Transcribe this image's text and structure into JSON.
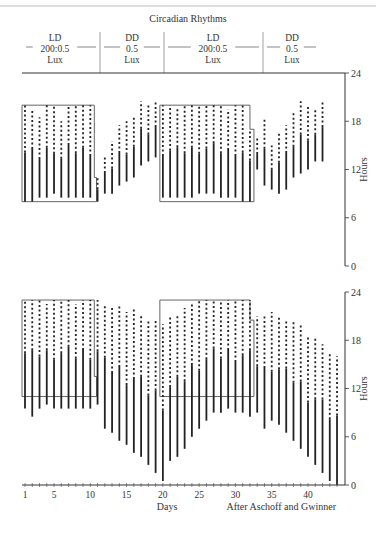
{
  "chart_data": [
    {
      "type": "actogram",
      "title": "Circadian Rhythms",
      "conditions": [
        {
          "label_lines": [
            "LD",
            "200:0.5",
            "Lux"
          ],
          "days": [
            1,
            10
          ]
        },
        {
          "label_lines": [
            "DD",
            "0.5",
            "Lux"
          ],
          "days": [
            11,
            19
          ]
        },
        {
          "label_lines": [
            "LD",
            "200:0.5",
            "Lux"
          ],
          "days": [
            20,
            32
          ]
        },
        {
          "label_lines": [
            "DD",
            "0.5",
            "Lux"
          ],
          "days": [
            33,
            43
          ]
        }
      ],
      "panel": "upper",
      "ylabel": "Hours",
      "ylim": [
        0,
        24
      ],
      "yticks": [
        0,
        6,
        12,
        18,
        24
      ],
      "light_boxes": [
        {
          "days": [
            1,
            10
          ],
          "hours": [
            8,
            20
          ],
          "step": {
            "after_day": 10.3,
            "bottom_hour": 11
          }
        },
        {
          "days": [
            20,
            32
          ],
          "hours": [
            8,
            20
          ],
          "step": {
            "after_day": 32,
            "top_hour": 17
          }
        }
      ],
      "activity": [
        {
          "day": 1,
          "start": 8,
          "end": 20
        },
        {
          "day": 2,
          "start": 8,
          "end": 19.5
        },
        {
          "day": 3,
          "start": 8.5,
          "end": 18.5
        },
        {
          "day": 4,
          "start": 8.5,
          "end": 20
        },
        {
          "day": 5,
          "start": 9,
          "end": 20
        },
        {
          "day": 6,
          "start": 8.5,
          "end": 18
        },
        {
          "day": 7,
          "start": 8.5,
          "end": 20
        },
        {
          "day": 8,
          "start": 8.5,
          "end": 20
        },
        {
          "day": 9,
          "start": 8.5,
          "end": 20
        },
        {
          "day": 10,
          "start": 8.5,
          "end": 20
        },
        {
          "day": 11,
          "start": 8,
          "end": 11
        },
        {
          "day": 12,
          "start": 9,
          "end": 13.5
        },
        {
          "day": 13,
          "start": 9,
          "end": 15.5
        },
        {
          "day": 14,
          "start": 10,
          "end": 17.5
        },
        {
          "day": 15,
          "start": 10.5,
          "end": 18
        },
        {
          "day": 16,
          "start": 11,
          "end": 18.5
        },
        {
          "day": 17,
          "start": 12.5,
          "end": 20.5
        },
        {
          "day": 18,
          "start": 13,
          "end": 20
        },
        {
          "day": 19,
          "start": 13.5,
          "end": 20.5
        },
        {
          "day": 20,
          "start": 8.5,
          "end": 20
        },
        {
          "day": 21,
          "start": 8.5,
          "end": 20
        },
        {
          "day": 22,
          "start": 8.5,
          "end": 19.5
        },
        {
          "day": 23,
          "start": 8.5,
          "end": 20
        },
        {
          "day": 24,
          "start": 8.5,
          "end": 20
        },
        {
          "day": 25,
          "start": 9,
          "end": 20
        },
        {
          "day": 26,
          "start": 9,
          "end": 20
        },
        {
          "day": 27,
          "start": 9,
          "end": 20
        },
        {
          "day": 28,
          "start": 8.5,
          "end": 20
        },
        {
          "day": 29,
          "start": 8.5,
          "end": 19.5
        },
        {
          "day": 30,
          "start": 8.5,
          "end": 20
        },
        {
          "day": 31,
          "start": 8,
          "end": 20
        },
        {
          "day": 32,
          "start": 8,
          "end": 17
        },
        {
          "day": 33,
          "start": 12,
          "end": 16
        },
        {
          "day": 34,
          "start": 10,
          "end": 18.5
        },
        {
          "day": 35,
          "start": 9.5,
          "end": 15
        },
        {
          "day": 36,
          "start": 9,
          "end": 16.5
        },
        {
          "day": 37,
          "start": 9.5,
          "end": 17.5
        },
        {
          "day": 38,
          "start": 11,
          "end": 19
        },
        {
          "day": 39,
          "start": 11.5,
          "end": 20.5
        },
        {
          "day": 40,
          "start": 12,
          "end": 20
        },
        {
          "day": 41,
          "start": 13,
          "end": 19.5
        },
        {
          "day": 42,
          "start": 13,
          "end": 20.5
        }
      ]
    },
    {
      "type": "actogram",
      "panel": "lower",
      "ylabel": "Hours",
      "ylim": [
        0,
        24
      ],
      "yticks": [
        0,
        6,
        12,
        18,
        24
      ],
      "xlabel": "Days",
      "xticks": [
        1,
        5,
        10,
        15,
        20,
        25,
        30,
        35,
        40
      ],
      "xlim": [
        1,
        44
      ],
      "credit": "After Aschoff and Gwinner",
      "light_boxes": [
        {
          "days": [
            1,
            10
          ],
          "hours": [
            11,
            23
          ],
          "step": {
            "after_day": 10.3,
            "bottom_hour": 13.5
          }
        },
        {
          "days": [
            20,
            32
          ],
          "hours": [
            11,
            23
          ],
          "step": {
            "after_day": 32,
            "top_hour": 20.5
          }
        }
      ],
      "activity": [
        {
          "day": 1,
          "start": 9.5,
          "end": 23
        },
        {
          "day": 2,
          "start": 8.5,
          "end": 23
        },
        {
          "day": 3,
          "start": 9.5,
          "end": 23
        },
        {
          "day": 4,
          "start": 10,
          "end": 22.5
        },
        {
          "day": 5,
          "start": 9.5,
          "end": 23
        },
        {
          "day": 6,
          "start": 9.5,
          "end": 23
        },
        {
          "day": 7,
          "start": 9.5,
          "end": 23
        },
        {
          "day": 8,
          "start": 9.5,
          "end": 22.5
        },
        {
          "day": 9,
          "start": 9.5,
          "end": 23
        },
        {
          "day": 10,
          "start": 9.5,
          "end": 23
        },
        {
          "day": 11,
          "start": 10,
          "end": 23
        },
        {
          "day": 12,
          "start": 7,
          "end": 22.5
        },
        {
          "day": 13,
          "start": 6.5,
          "end": 22
        },
        {
          "day": 14,
          "start": 5.5,
          "end": 22.5
        },
        {
          "day": 15,
          "start": 5,
          "end": 21.5
        },
        {
          "day": 16,
          "start": 4,
          "end": 22
        },
        {
          "day": 17,
          "start": 3.5,
          "end": 21
        },
        {
          "day": 18,
          "start": 2.5,
          "end": 20.5
        },
        {
          "day": 19,
          "start": 1.5,
          "end": 20.5
        },
        {
          "day": 20,
          "start": 0.5,
          "end": 20
        },
        {
          "day": 21,
          "start": 3,
          "end": 21
        },
        {
          "day": 22,
          "start": 3.5,
          "end": 21
        },
        {
          "day": 23,
          "start": 4.5,
          "end": 22
        },
        {
          "day": 24,
          "start": 6,
          "end": 22.5
        },
        {
          "day": 25,
          "start": 7,
          "end": 23
        },
        {
          "day": 26,
          "start": 8,
          "end": 23
        },
        {
          "day": 27,
          "start": 9,
          "end": 23
        },
        {
          "day": 28,
          "start": 9,
          "end": 23
        },
        {
          "day": 29,
          "start": 9.5,
          "end": 23
        },
        {
          "day": 30,
          "start": 9,
          "end": 23
        },
        {
          "day": 31,
          "start": 9,
          "end": 23
        },
        {
          "day": 32,
          "start": 8.5,
          "end": 23
        },
        {
          "day": 33,
          "start": 9,
          "end": 21
        },
        {
          "day": 34,
          "start": 7,
          "end": 21
        },
        {
          "day": 35,
          "start": 8,
          "end": 21.5
        },
        {
          "day": 36,
          "start": 7.5,
          "end": 21
        },
        {
          "day": 37,
          "start": 6.5,
          "end": 20.5
        },
        {
          "day": 38,
          "start": 5.5,
          "end": 20.5
        },
        {
          "day": 39,
          "start": 4.5,
          "end": 20
        },
        {
          "day": 40,
          "start": 3.5,
          "end": 18.5
        },
        {
          "day": 41,
          "start": 2.5,
          "end": 18.5
        },
        {
          "day": 42,
          "start": 1.5,
          "end": 17.5
        },
        {
          "day": 43,
          "start": 0.5,
          "end": 16.5
        },
        {
          "day": 44,
          "start": 0,
          "end": 16
        }
      ]
    }
  ]
}
